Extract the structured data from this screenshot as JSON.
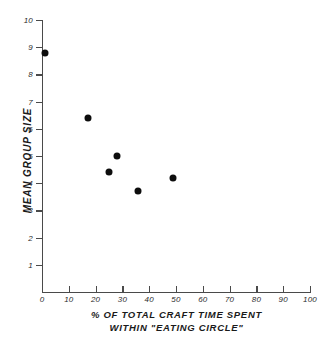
{
  "chart_data": {
    "type": "scatter",
    "title": "",
    "xlabel": "% OF TOTAL CRAFT TIME SPENT WITHIN \"EATING CIRCLE\"",
    "xlabel_line1": "% OF TOTAL CRAFT TIME SPENT",
    "xlabel_line2": "WITHIN \"EATING CIRCLE\"",
    "ylabel": "MEAN GROUP SIZE",
    "xlim": [
      0,
      100
    ],
    "ylim": [
      0,
      10
    ],
    "grid": false,
    "legend": null,
    "xticks": [
      0,
      10,
      20,
      30,
      40,
      50,
      60,
      70,
      80,
      90,
      100
    ],
    "xtick_labels": [
      "0",
      "10",
      "20",
      "30",
      "40",
      "50",
      "60",
      "70",
      "80",
      "90",
      "100"
    ],
    "yticks": [
      1,
      2,
      3,
      4,
      5,
      6,
      7,
      8,
      9,
      10
    ],
    "ytick_labels": [
      "1",
      "2",
      "3",
      "4",
      "5",
      "6",
      "7",
      "8",
      "9",
      "10"
    ],
    "marker": "filled-circle",
    "marker_color": "#0d0d0d",
    "axis_color": "#4a4a4a",
    "points": [
      {
        "x": 1,
        "y": 8.8
      },
      {
        "x": 17,
        "y": 6.4
      },
      {
        "x": 25,
        "y": 4.4
      },
      {
        "x": 28,
        "y": 5.0
      },
      {
        "x": 36,
        "y": 3.7
      },
      {
        "x": 49,
        "y": 4.2
      }
    ]
  }
}
